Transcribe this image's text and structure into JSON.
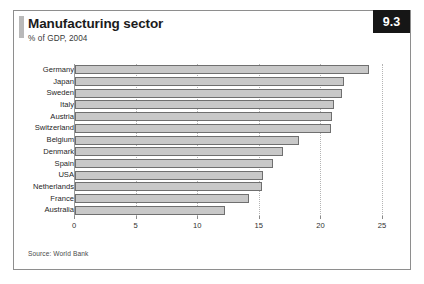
{
  "card": {
    "badge": "9.3",
    "title": "Manufacturing sector",
    "subtitle": "% of GDP, 2004",
    "source": "Source: World Bank"
  },
  "chart_data": {
    "type": "bar",
    "orientation": "horizontal",
    "title": "Manufacturing sector",
    "subtitle": "% of GDP, 2004",
    "xlabel": "",
    "ylabel": "",
    "xlim": [
      0,
      25
    ],
    "xticks": [
      0,
      5,
      10,
      15,
      20,
      25
    ],
    "xtick_labels": [
      "0",
      "5",
      "10",
      "15",
      "20",
      "25"
    ],
    "grid": true,
    "legend": null,
    "bar_color": "#c8c8c8",
    "bar_border_color": "#6f6f6f",
    "categories": [
      "Germany",
      "Japan",
      "Sweden",
      "Italy",
      "Austria",
      "Switzerland",
      "Belgium",
      "Denmark",
      "Spain",
      "USA",
      "Netherlands",
      "France",
      "Australia"
    ],
    "values": [
      23.9,
      21.8,
      21.7,
      21.0,
      20.9,
      20.8,
      18.2,
      16.9,
      16.1,
      15.3,
      15.2,
      14.1,
      12.2
    ]
  }
}
